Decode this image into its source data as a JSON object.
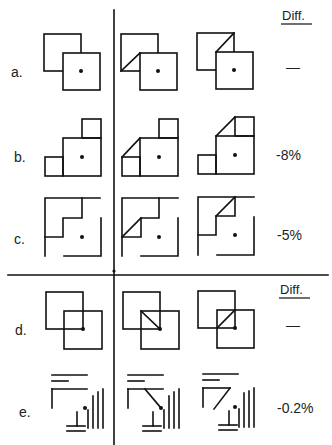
{
  "header": {
    "top_column_label": "Diff.",
    "bottom_column_label": "Diff."
  },
  "rows": [
    {
      "label": "a.",
      "diff": "—"
    },
    {
      "label": "b.",
      "diff": "-8%"
    },
    {
      "label": "c.",
      "diff": "-5%"
    },
    {
      "label": "d.",
      "diff": "—"
    },
    {
      "label": "e.",
      "diff": "-0.2%"
    }
  ],
  "colors": {
    "ink": "#111111",
    "background": "#ffffff"
  }
}
